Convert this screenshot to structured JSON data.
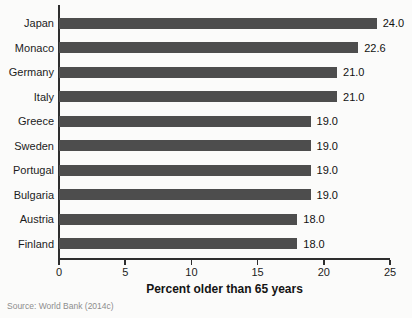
{
  "chart_data": {
    "type": "bar",
    "orientation": "horizontal",
    "categories": [
      "Japan",
      "Monaco",
      "Germany",
      "Italy",
      "Greece",
      "Sweden",
      "Portugal",
      "Bulgaria",
      "Austria",
      "Finland"
    ],
    "values": [
      24.0,
      22.6,
      21.0,
      21.0,
      19.0,
      19.0,
      19.0,
      19.0,
      18.0,
      18.0
    ],
    "value_labels": [
      "24.0",
      "22.6",
      "21.0",
      "21.0",
      "19.0",
      "19.0",
      "19.0",
      "19.0",
      "18.0",
      "18.0"
    ],
    "title": "",
    "xlabel": "Percent older than 65 years",
    "ylabel": "",
    "xlim": [
      0,
      25
    ],
    "x_ticks": [
      0,
      5,
      10,
      15,
      20,
      25
    ],
    "grid": false,
    "legend": false,
    "bar_color": "#4d4d4d",
    "axis_color": "#2e2e2e",
    "text_color": "#1c1c1c"
  },
  "source_note": "Source: World Bank (2014c)"
}
